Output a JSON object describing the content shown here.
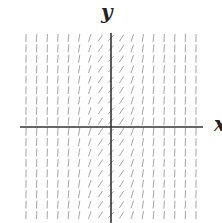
{
  "axes": {
    "x_label": "x",
    "y_label": "y"
  },
  "field": {
    "description": "slope field where slope depends only on x; shallowest (slope ~1) near x=0, near-vertical far from the y-axis",
    "columns": 17,
    "rows": 18,
    "segment_color": "#9a9a9a",
    "axis_color": "#333333"
  }
}
